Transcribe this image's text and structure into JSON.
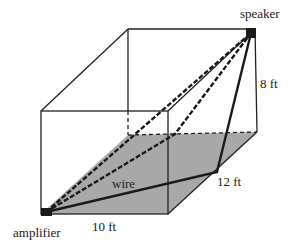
{
  "diagram": {
    "type": "3d-box-wire-path",
    "labels": {
      "speaker": "speaker",
      "amplifier": "amplifier",
      "wire": "wire",
      "width": "10 ft",
      "depth": "12 ft",
      "height": "8 ft"
    },
    "colors": {
      "floor_shade": "#a8a8a8",
      "edge": "#222222",
      "device": "#1a1a1a"
    }
  }
}
